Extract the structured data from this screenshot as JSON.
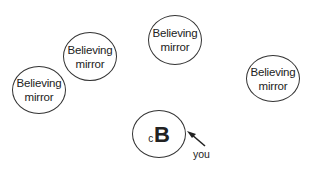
{
  "diagram": {
    "nodes": [
      {
        "id": "mirror-1",
        "line1": "Believing",
        "line2": "mirror"
      },
      {
        "id": "mirror-2",
        "line1": "Believing",
        "line2": "mirror"
      },
      {
        "id": "mirror-3",
        "line1": "Believing",
        "line2": "mirror"
      },
      {
        "id": "mirror-4",
        "line1": "Believing",
        "line2": "mirror"
      }
    ],
    "self": {
      "subscript": "c",
      "letter": "B"
    },
    "pointer_label": "you",
    "colors": {
      "stroke": "#333333",
      "text": "#222222",
      "background": "#ffffff"
    }
  }
}
